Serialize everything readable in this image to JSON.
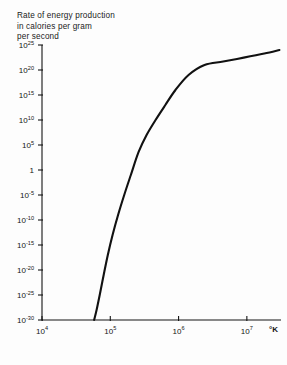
{
  "chart_data": {
    "type": "line",
    "title": "Rate of energy production\nin calories per gram\nper second",
    "xlabel": "°K",
    "ylabel": "Rate of energy production in calories per gram per second",
    "xscale": "log",
    "yscale": "log",
    "xlim": [
      10000,
      31622776
    ],
    "ylim": [
      1e-30,
      1e+25
    ],
    "grid": false,
    "legend": null,
    "x_ticks": [
      {
        "value": 10000,
        "label": "10",
        "exponent": "4"
      },
      {
        "value": 100000,
        "label": "10",
        "exponent": "5"
      },
      {
        "value": 1000000,
        "label": "10",
        "exponent": "6"
      },
      {
        "value": 10000000,
        "label": "10",
        "exponent": "7"
      }
    ],
    "y_ticks": [
      {
        "value": 1e+25,
        "label": "10",
        "exponent": "25"
      },
      {
        "value": 1e+20,
        "label": "10",
        "exponent": "20"
      },
      {
        "value": 1000000000000000.0,
        "label": "10",
        "exponent": "15"
      },
      {
        "value": 10000000000.0,
        "label": "10",
        "exponent": "10"
      },
      {
        "value": 100000.0,
        "label": "10",
        "exponent": "5"
      },
      {
        "value": 1,
        "label": "1",
        "exponent": ""
      },
      {
        "value": 1e-05,
        "label": "10",
        "exponent": "-5"
      },
      {
        "value": 1e-10,
        "label": "10",
        "exponent": "-10"
      },
      {
        "value": 1e-15,
        "label": "10",
        "exponent": "-15"
      },
      {
        "value": 1e-20,
        "label": "10",
        "exponent": "-20"
      },
      {
        "value": 1e-25,
        "label": "10",
        "exponent": "-25"
      },
      {
        "value": 1e-30,
        "label": "10",
        "exponent": "-30"
      }
    ],
    "series": [
      {
        "name": "energy production rate",
        "color": "#111111",
        "points": [
          [
            58000,
            1e-30
          ],
          [
            63000,
            1e-28
          ],
          [
            70000,
            1e-25
          ],
          [
            80000,
            1e-21
          ],
          [
            92000,
            1e-17
          ],
          [
            108000,
            1e-13
          ],
          [
            130000,
            1e-09
          ],
          [
            160000,
            1e-05
          ],
          [
            200000,
            0.1
          ],
          [
            260000,
            4000.0
          ],
          [
            340000,
            10000000.0
          ],
          [
            460000,
            10000000000.0
          ],
          [
            640000,
            10000000000000.0
          ],
          [
            900000,
            1e+16
          ],
          [
            1400000,
            1e+19
          ],
          [
            2400000,
            1e+21
          ],
          [
            4500000,
            5e+21
          ],
          [
            9000000,
            3e+22
          ],
          [
            18000000,
            2e+23
          ],
          [
            30000000,
            1e+24
          ]
        ]
      }
    ]
  }
}
